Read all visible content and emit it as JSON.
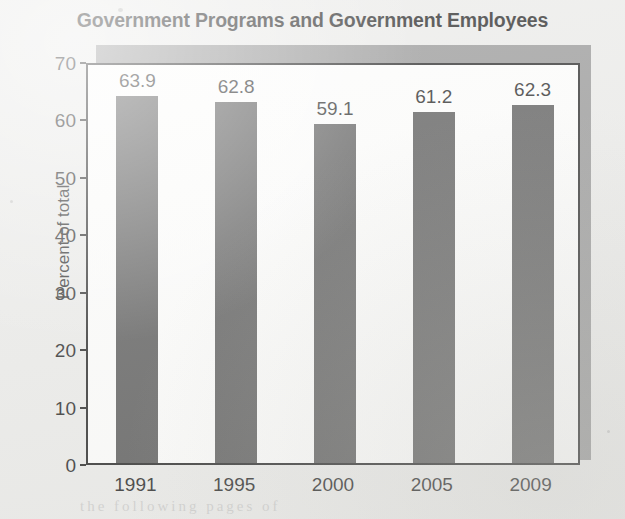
{
  "chart_data": {
    "type": "bar",
    "title": "Government Programs and Government Employees",
    "xlabel": "",
    "ylabel": "Percent of total",
    "categories": [
      "1991",
      "1995",
      "2000",
      "2005",
      "2009"
    ],
    "values": [
      63.9,
      62.8,
      59.1,
      61.2,
      62.3
    ],
    "value_labels": [
      "63.9",
      "62.8",
      "59.1",
      "61.2",
      "62.3"
    ],
    "ylim": [
      0,
      70
    ],
    "yticks": [
      0,
      10,
      20,
      30,
      40,
      50,
      60,
      70
    ],
    "ytick_labels": [
      "0",
      "10",
      "20",
      "30",
      "40",
      "50",
      "60",
      "70"
    ],
    "grid": false,
    "legend": null,
    "bar_color": "#4d4d4d",
    "plot_background": "#fdfdfc",
    "shadow_color": "#8e8e8e",
    "page_background": "#e9e9e7",
    "axis_color": "#161616",
    "text_color": "#141414"
  },
  "footer": {
    "bleed_through": "the following pages of"
  }
}
